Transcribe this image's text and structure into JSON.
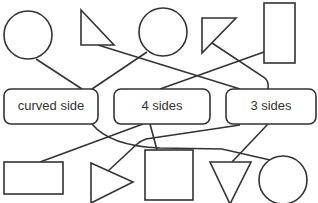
{
  "diagram": {
    "type": "matching-shapes-to-categories",
    "categories": [
      {
        "id": "curved",
        "label": "curved side"
      },
      {
        "id": "four",
        "label": "4 sides"
      },
      {
        "id": "three",
        "label": "3 sides"
      }
    ],
    "top_shapes": [
      {
        "id": "top-circle-1",
        "kind": "circle",
        "category": "curved"
      },
      {
        "id": "top-triangle-1",
        "kind": "triangle",
        "category": "three"
      },
      {
        "id": "top-circle-2",
        "kind": "circle",
        "category": "curved"
      },
      {
        "id": "top-triangle-2",
        "kind": "triangle",
        "category": "three"
      },
      {
        "id": "top-rectangle",
        "kind": "rectangle",
        "category": "four"
      }
    ],
    "bottom_shapes": [
      {
        "id": "bottom-rectangle",
        "kind": "rectangle",
        "category": "four"
      },
      {
        "id": "bottom-triangle-right",
        "kind": "triangle",
        "category": "three"
      },
      {
        "id": "bottom-square",
        "kind": "square",
        "category": "four"
      },
      {
        "id": "bottom-triangle-down",
        "kind": "triangle",
        "category": "three"
      },
      {
        "id": "bottom-circle",
        "kind": "circle",
        "category": "curved"
      }
    ],
    "colors": {
      "stroke": "#333333",
      "background": "#ffffff"
    }
  }
}
